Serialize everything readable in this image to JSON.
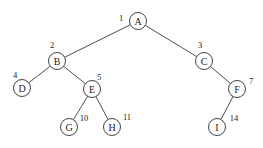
{
  "diagram": {
    "type": "binary-tree",
    "node_radius": 8.5,
    "colors": {
      "background": "#ffffff",
      "stroke": "#2e2e2e",
      "text": "#222222"
    },
    "nodes": [
      {
        "id": "A",
        "label": "A",
        "index": "1",
        "x": 138,
        "y": 21,
        "index_x": 121,
        "index_y": 18
      },
      {
        "id": "B",
        "label": "B",
        "index": "2",
        "x": 57,
        "y": 61,
        "index_x": 52,
        "index_y": 45
      },
      {
        "id": "C",
        "label": "C",
        "index": "3",
        "x": 204,
        "y": 61,
        "index_x": 200,
        "index_y": 45
      },
      {
        "id": "D",
        "label": "D",
        "index": "4",
        "x": 22,
        "y": 88,
        "index_x": 15,
        "index_y": 75
      },
      {
        "id": "E",
        "label": "E",
        "index": "5",
        "x": 92,
        "y": 89,
        "index_x": 99,
        "index_y": 77
      },
      {
        "id": "F",
        "label": "F",
        "index": "7",
        "x": 237,
        "y": 89,
        "index_x": 251,
        "index_y": 81
      },
      {
        "id": "G",
        "label": "G",
        "index": "10",
        "x": 69,
        "y": 127,
        "index_x": 84,
        "index_y": 118
      },
      {
        "id": "H",
        "label": "H",
        "index": "11",
        "x": 112,
        "y": 127,
        "index_x": 127,
        "index_y": 117
      },
      {
        "id": "I",
        "label": "I",
        "index": "14",
        "x": 217,
        "y": 127,
        "index_x": 234,
        "index_y": 118
      }
    ],
    "edges": [
      {
        "from": "A",
        "to": "B"
      },
      {
        "from": "A",
        "to": "C"
      },
      {
        "from": "B",
        "to": "D"
      },
      {
        "from": "B",
        "to": "E"
      },
      {
        "from": "C",
        "to": "F"
      },
      {
        "from": "E",
        "to": "G"
      },
      {
        "from": "E",
        "to": "H"
      },
      {
        "from": "F",
        "to": "I"
      }
    ]
  }
}
